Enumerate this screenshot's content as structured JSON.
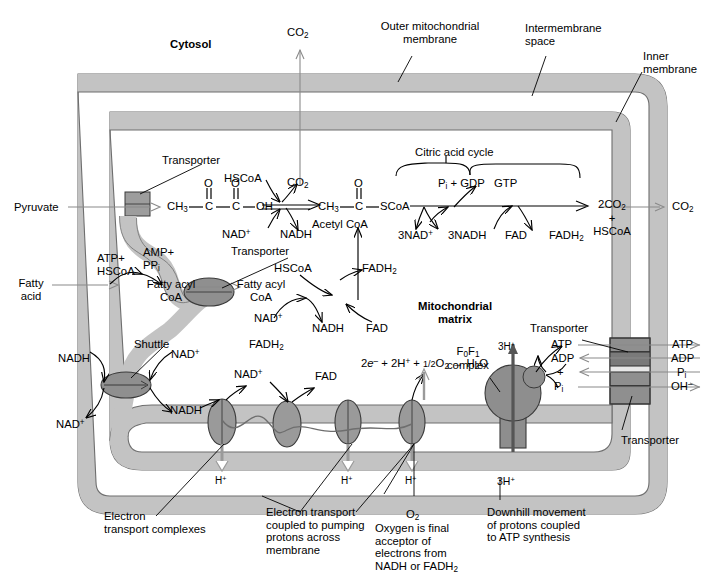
{
  "figure": {
    "domain": "biochemistry-pathway-diagram"
  },
  "colors": {
    "membrane_fill": "#c3c3c3",
    "membrane_stroke": "#6e6e6e",
    "matrix_fill": "#ffffff",
    "complex_fill": "#9a9a9a",
    "complex_stroke": "#3a3a3a",
    "transporter_fill": "#8f8f8f",
    "f0f1_fill": "#8e8e8e",
    "line": "#000000",
    "text": "#000000",
    "gray_arrow": "#7a7a7a"
  },
  "compartments": {
    "cytosol": "Cytosol",
    "outer_membrane": "Outer mitochondrial\nmembrane",
    "intermembrane_space": "Intermembrane\nspace",
    "inner_membrane": "Inner\nmembrane",
    "matrix": "Mitochondrial\nmatrix"
  },
  "pyruvate_pathway": {
    "substrate": "Pyruvate",
    "transporter": "Transporter",
    "co2_out_top": "CO2",
    "co2_reaction": "CO2",
    "hscoa": "HSCoA",
    "nad_plus": "NAD+",
    "nadh": "NADH",
    "pyruvate_structure": {
      "ch3": "CH3",
      "c1": "C",
      "c2": "C",
      "oh": "OH",
      "o1": "O",
      "o2": "O"
    },
    "acetyl_structure": {
      "ch3": "CH3",
      "c": "C",
      "scoa": "SCoA",
      "o": "O"
    },
    "acetyl_label": "Acetyl CoA"
  },
  "citric_acid_cycle": {
    "bracket_label": "Citric acid cycle",
    "pi_gdp": "Pi + GDP",
    "gtp": "GTP",
    "nad_plus_3": "3NAD+",
    "nadh_3": "3NADH",
    "fad": "FAD",
    "fadh2": "FADH2",
    "products": "2CO2\n+\nHSCoA",
    "co2_exported": "CO2"
  },
  "fatty_acid_pathway": {
    "substrate": "Fatty\nacid",
    "activation_in": "ATP+\nHSCoA",
    "activation_out": "AMP+\nPPi",
    "cytosolic_product": "Fatty acyl\nCoA",
    "transporter": "Transporter",
    "matrix_product": "Fatty acyl\nCoA",
    "hscoa": "HSCoA",
    "nad_plus": "NAD+",
    "nadh": "NADH",
    "fad": "FAD",
    "fadh2": "FADH2"
  },
  "shuttle": {
    "label": "Shuttle",
    "cyt_nadh": "NADH",
    "cyt_nad_plus": "NAD+",
    "matrix_nad_plus": "NAD+",
    "matrix_nadh": "NADH"
  },
  "electron_transport": {
    "nadh_in": "NADH",
    "nad_plus_out": "NAD+",
    "fadh2_in": "FADH2",
    "fad_out": "FAD",
    "proton_labels": [
      "H+",
      "H+",
      "H+"
    ],
    "oxygen_reaction": "2e– + 2H+ + 1/2O2 → H2O",
    "complex_count": 4,
    "caption_complexes": "Electron\ntransport complexes",
    "caption_pumping": "Electron transport\ncoupled to pumping\nprotons across\nmembrane",
    "caption_oxygen_title": "O2",
    "caption_oxygen": "Oxygen is final\nacceptor of\nelectrons from\nNADH or FADH2"
  },
  "atp_synthase": {
    "label": "F0F1\ncomplex",
    "protons_in": "3H+",
    "protons_out": "3H+",
    "atp": "ATP",
    "adp": "ADP",
    "plus": "+",
    "pi": "Pi",
    "caption": "Downhill movement\nof protons coupled\nto ATP synthesis"
  },
  "adenine_transporter": {
    "label_top": "Transporter",
    "label_bottom": "Transporter",
    "exports": [
      "ATP",
      "ADP",
      "Pi",
      "OH–"
    ]
  }
}
